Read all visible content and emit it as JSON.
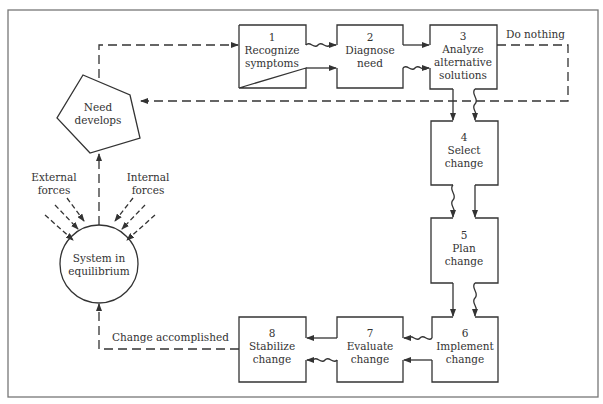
{
  "diagram": {
    "title": "",
    "colors": {
      "line": "#333333",
      "background": "#ffffff",
      "border": "#777777"
    },
    "start_nodes": {
      "system": {
        "line1": "System in",
        "line2": "equilibrium",
        "shape": "circle"
      },
      "need": {
        "line1": "Need",
        "line2": "develops",
        "shape": "pentagon"
      }
    },
    "forces": {
      "external": {
        "line1": "External",
        "line2": "forces"
      },
      "internal": {
        "line1": "Internal",
        "line2": "forces"
      }
    },
    "steps": [
      {
        "num": "1",
        "line1": "Recognize",
        "line2": "symptoms",
        "line3": ""
      },
      {
        "num": "2",
        "line1": "Diagnose",
        "line2": "need",
        "line3": ""
      },
      {
        "num": "3",
        "line1": "Analyze",
        "line2": "alternative",
        "line3": "solutions"
      },
      {
        "num": "4",
        "line1": "Select",
        "line2": "change",
        "line3": ""
      },
      {
        "num": "5",
        "line1": "Plan",
        "line2": "change",
        "line3": ""
      },
      {
        "num": "6",
        "line1": "Implement",
        "line2": "change",
        "line3": ""
      },
      {
        "num": "7",
        "line1": "Evaluate",
        "line2": "change",
        "line3": ""
      },
      {
        "num": "8",
        "line1": "Stabilize",
        "line2": "change",
        "line3": ""
      }
    ],
    "edge_labels": {
      "do_nothing": "Do nothing",
      "change_accomplished": "Change accomplished"
    }
  }
}
